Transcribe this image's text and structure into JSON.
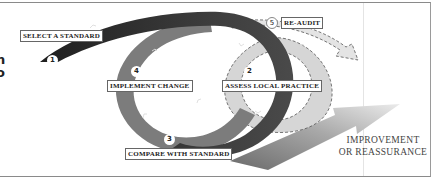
{
  "diagram": {
    "type": "audit-cycle",
    "clipped_left_text": [
      "n",
      "o"
    ],
    "steps": [
      {
        "number": "1",
        "label": "SELECT A STANDARD"
      },
      {
        "number": "2",
        "label": "ASSESS LOCAL PRACTICE"
      },
      {
        "number": "3",
        "label": "COMPARE WITH STANDARD"
      },
      {
        "number": "4",
        "label": "IMPLEMENT CHANGE"
      },
      {
        "number": "5",
        "label": "RE-AUDIT"
      }
    ],
    "outcome": {
      "line1": "IMPROVEMENT",
      "line2": "OR REASSURANCE"
    },
    "colors": {
      "dark_ribbon": "#2b2b2b",
      "medium_loop": "#7a7a7a",
      "light_loop": "#d4d4d4",
      "arrow_start": "#6e6e6e",
      "arrow_end": "#e6e6e6"
    }
  }
}
